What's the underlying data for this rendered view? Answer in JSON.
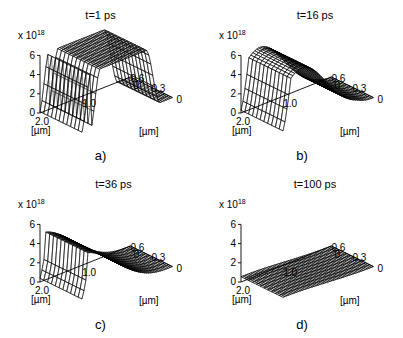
{
  "figure": {
    "panel_count": 4,
    "background_color": "#ffffff",
    "line_color": "#000000"
  },
  "chart_data": [
    {
      "type": "surface",
      "panel": "a",
      "title": "t=1 ps",
      "caption": "a)",
      "xlabel": "[µm]",
      "ylabel": "[µm]",
      "zlabel": "",
      "z_scale_label": "x 10",
      "z_scale_exponent": "18",
      "x_ticks": [
        "2.0",
        "1.0",
        "0"
      ],
      "x_tick_values": [
        2.0,
        1.0,
        0
      ],
      "y_ticks": [
        "0.6",
        "0.3",
        "0"
      ],
      "y_tick_values": [
        0.6,
        0.3,
        0
      ],
      "z_ticks": [
        "0",
        "2",
        "4",
        "6"
      ],
      "z_tick_values": [
        0,
        2,
        4,
        6
      ],
      "xlim": [
        0,
        2.0
      ],
      "ylim": [
        0,
        0.6
      ],
      "zlim": [
        0,
        6
      ],
      "grid": true,
      "legend": "none",
      "description": "Flat-topped plateau ridge: carrier density saturated near 6e18 over a broad central region, with steep trapezoidal side walls falling to zero.",
      "profile": {
        "shape": "plateau",
        "peak": 6.0,
        "plateau_x_range": [
          0.45,
          1.75
        ],
        "edge_falloff": "steep"
      }
    },
    {
      "type": "surface",
      "panel": "b",
      "title": "t=16 ps",
      "caption": "b)",
      "xlabel": "[µm]",
      "ylabel": "[µm]",
      "zlabel": "",
      "z_scale_label": "x 10",
      "z_scale_exponent": "18",
      "x_ticks": [
        "2.0",
        "1.0",
        "0"
      ],
      "x_tick_values": [
        2.0,
        1.0,
        0
      ],
      "y_ticks": [
        "0.6",
        "0.3",
        "0"
      ],
      "y_tick_values": [
        0.6,
        0.3,
        0
      ],
      "z_ticks": [
        "0",
        "2",
        "4",
        "6"
      ],
      "z_tick_values": [
        0,
        2,
        4,
        6
      ],
      "xlim": [
        0,
        2.0
      ],
      "ylim": [
        0,
        0.6
      ],
      "zlim": [
        0,
        6
      ],
      "grid": true,
      "legend": "none",
      "description": "Rounded dome peaking near 6e18 toward the back-left, decaying smoothly to zero across the front-right region.",
      "profile": {
        "shape": "dome",
        "peak": 6.0,
        "peak_x": 1.55,
        "edge_falloff": "smooth"
      }
    },
    {
      "type": "surface",
      "panel": "c",
      "title": "t=36 ps",
      "caption": "c)",
      "xlabel": "[µm]",
      "ylabel": "[µm]",
      "zlabel": "",
      "z_scale_label": "x 10",
      "z_scale_exponent": "18",
      "x_ticks": [
        "2.0",
        "1.0",
        "0"
      ],
      "x_tick_values": [
        2.0,
        1.0,
        0
      ],
      "y_ticks": [
        "0.6",
        "0.3",
        "0"
      ],
      "y_tick_values": [
        0.6,
        0.3,
        0
      ],
      "z_ticks": [
        "0",
        "2",
        "4",
        "6"
      ],
      "z_tick_values": [
        0,
        2,
        4,
        6
      ],
      "xlim": [
        0,
        2.0
      ],
      "ylim": [
        0,
        0.6
      ],
      "zlim": [
        0,
        6
      ],
      "grid": true,
      "legend": "none",
      "description": "Broad low ramp peaking around 5e18 at the back-left corner and sloping monotonically down toward the front-right.",
      "profile": {
        "shape": "ramp",
        "peak": 5.0,
        "peak_x": 1.95,
        "edge_falloff": "gradual"
      }
    },
    {
      "type": "surface",
      "panel": "d",
      "title": "t=100 ps",
      "caption": "d)",
      "xlabel": "[µm]",
      "ylabel": "[µm]",
      "zlabel": "",
      "z_scale_label": "x 10",
      "z_scale_exponent": "18",
      "x_ticks": [
        "2.0",
        "1.0",
        "0"
      ],
      "x_tick_values": [
        2.0,
        1.0,
        0
      ],
      "y_ticks": [
        "0.6",
        "0.3",
        "0"
      ],
      "y_tick_values": [
        0.6,
        0.3,
        0
      ],
      "z_ticks": [
        "0",
        "2",
        "4",
        "6"
      ],
      "z_tick_values": [
        0,
        2,
        4,
        6
      ],
      "xlim": [
        0,
        2.0
      ],
      "ylim": [
        0,
        0.6
      ],
      "zlim": [
        0,
        6
      ],
      "grid": true,
      "legend": "none",
      "description": "Nearly flat plane close to zero, showing almost complete decay of the carrier density.",
      "profile": {
        "shape": "flat",
        "peak": 0.55,
        "peak_x": 2.0,
        "edge_falloff": "none"
      }
    }
  ]
}
